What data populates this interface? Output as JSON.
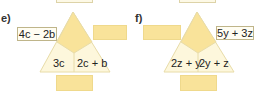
{
  "colors": {
    "top_region": "#f9e39a",
    "bottom_region": "#fdf7dc",
    "outline": "#e8dca8",
    "answer_box": "#f9e39a"
  },
  "puzzles": [
    {
      "label": "e)",
      "left_box": "4c − 2b",
      "right_box": "",
      "bottom_left": "3c",
      "bottom_right": "2c + b",
      "bottom_box": ""
    },
    {
      "label": "f)",
      "left_box": "",
      "right_box": "5y + 3z",
      "bottom_left": "2z + y",
      "bottom_right": "2y + z",
      "bottom_box": ""
    }
  ]
}
